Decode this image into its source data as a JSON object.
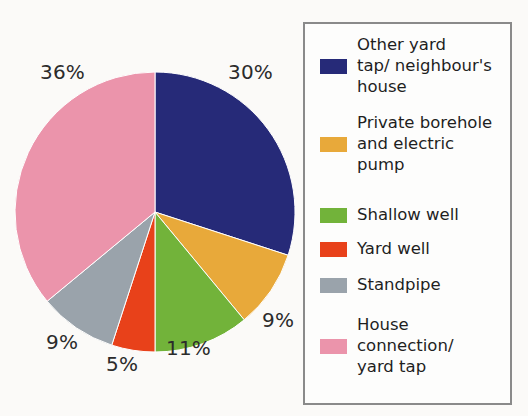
{
  "chart_data": {
    "type": "pie",
    "title": "",
    "categories": [
      "Other yard tap/ neighbour's house",
      "Private borehole and electric pump",
      "Shallow well",
      "Yard well",
      "Standpipe",
      "House connection/ yard tap"
    ],
    "values": [
      30,
      9,
      11,
      5,
      9,
      36
    ],
    "value_labels": [
      "30%",
      "9%",
      "11%",
      "5%",
      "9%",
      "36%"
    ],
    "unit": "%",
    "colors": [
      "#262a78",
      "#e8a93a",
      "#72b33a",
      "#e8411a",
      "#9aa3ab",
      "#eb94ab"
    ],
    "start_angle_deg": 0,
    "direction": "clockwise",
    "legend_position": "right",
    "grid": false
  },
  "pie": {
    "slices": [
      {
        "name": "other-yard-tap",
        "label": "30%",
        "value": 30,
        "color": "#262a78"
      },
      {
        "name": "private-borehole",
        "label": "9%",
        "value": 9,
        "color": "#e8a93a"
      },
      {
        "name": "shallow-well",
        "label": "11%",
        "value": 11,
        "color": "#72b33a"
      },
      {
        "name": "yard-well",
        "label": "5%",
        "value": 5,
        "color": "#e8411a"
      },
      {
        "name": "standpipe",
        "label": "9%",
        "value": 9,
        "color": "#9aa3ab"
      },
      {
        "name": "house-connection",
        "label": "36%",
        "value": 36,
        "color": "#eb94ab"
      }
    ],
    "labels": {
      "navy": "30%",
      "orange": "9%",
      "green": "11%",
      "red": "5%",
      "gray": "9%",
      "pink": "36%"
    }
  },
  "legend": {
    "items": [
      {
        "key": "other-yard-tap",
        "color": "#262a78",
        "lines": [
          "Other yard",
          "tap/ neighbour's",
          "house"
        ]
      },
      {
        "key": "private-borehole",
        "color": "#e8a93a",
        "lines": [
          "Private borehole",
          "and electric",
          "pump"
        ]
      },
      {
        "key": "shallow-well",
        "color": "#72b33a",
        "lines": [
          "Shallow well"
        ]
      },
      {
        "key": "yard-well",
        "color": "#e8411a",
        "lines": [
          "Yard well"
        ]
      },
      {
        "key": "standpipe",
        "color": "#9aa3ab",
        "lines": [
          "Standpipe"
        ]
      },
      {
        "key": "house-connection",
        "color": "#eb94ab",
        "lines": [
          "House",
          "connection/",
          "yard tap"
        ]
      }
    ]
  }
}
